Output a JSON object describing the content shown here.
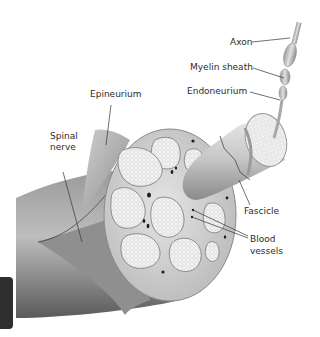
{
  "diagram": {
    "labels": {
      "axon": "Axon",
      "myelin_sheath": "Myelin sheath",
      "endoneurium": "Endoneurium",
      "epineurium": "Epineurium",
      "spinal_nerve_line1": "Spinal",
      "spinal_nerve_line2": "nerve",
      "fascicle": "Fascicle",
      "blood_vessels_line1": "Blood",
      "blood_vessels_line2": "vessels"
    },
    "colors": {
      "nerve_dark": "#6e6e6e",
      "nerve_mid": "#a9a9a9",
      "nerve_light": "#d9d9d9",
      "fascicle_fill": "#ececec",
      "fascicle_border": "#8c8c8c",
      "vessel": "#1e1e1e",
      "text": "#2b2b2b"
    }
  }
}
